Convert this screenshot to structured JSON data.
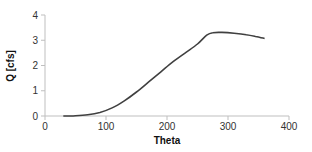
{
  "chart_data": {
    "type": "line",
    "title": "",
    "xlabel": "Theta",
    "ylabel": "Q [cfs]",
    "xlim": [
      0,
      400
    ],
    "ylim": [
      0,
      4
    ],
    "xticks": [
      0,
      100,
      200,
      300,
      400
    ],
    "yticks": [
      0,
      1,
      2,
      3,
      4
    ],
    "grid": false,
    "legend": null,
    "series": [
      {
        "name": "Q",
        "color": "#404040",
        "x": [
          30,
          50,
          70,
          90,
          110,
          130,
          150,
          170,
          190,
          210,
          230,
          250,
          265,
          275,
          290,
          310,
          330,
          345,
          360
        ],
        "y": [
          0.0,
          0.01,
          0.05,
          0.14,
          0.32,
          0.6,
          0.95,
          1.35,
          1.75,
          2.15,
          2.5,
          2.85,
          3.2,
          3.3,
          3.31,
          3.28,
          3.22,
          3.15,
          3.07
        ]
      }
    ]
  }
}
